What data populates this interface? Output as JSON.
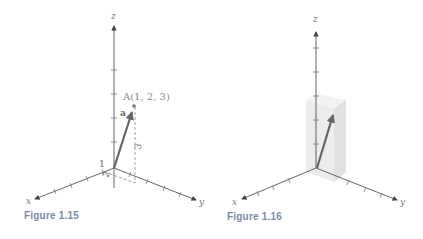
{
  "figures": [
    {
      "id": "fig-1-15",
      "caption": "Figure 1.15",
      "axis_labels": {
        "x": "x",
        "y": "y",
        "z": "z"
      },
      "point_label": "A(1, 2, 3)",
      "vector_label": "a",
      "component_labels": {
        "x": "1",
        "y": "2",
        "z": "3"
      },
      "point": [
        1,
        2,
        3
      ]
    },
    {
      "id": "fig-1-16",
      "caption": "Figure 1.16",
      "axis_labels": {
        "x": "x",
        "y": "y",
        "z": "z"
      },
      "point": [
        1,
        2,
        3
      ],
      "box_shown": true
    }
  ],
  "colors": {
    "caption": "#7a8aa6",
    "vector": "#666666",
    "box_fill": "#e6e6e6"
  }
}
